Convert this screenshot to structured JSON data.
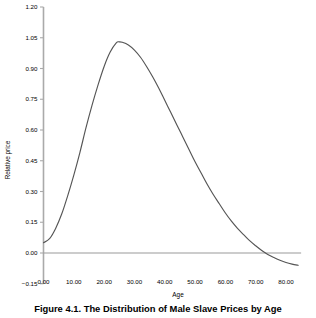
{
  "figure": {
    "caption": "Figure 4.1. The Distribution of Male Slave Prices by Age"
  },
  "chart_data": {
    "type": "line",
    "title": "",
    "subtitle": "",
    "xlabel": "Age",
    "ylabel": "Relative price",
    "xlim": [
      0,
      84
    ],
    "ylim": [
      -0.15,
      1.2
    ],
    "grid": false,
    "legend": null,
    "legend_position": "none",
    "annotations": [],
    "line_color": "#555555",
    "zero_line_color": "#999999",
    "axis_color": "#aaaaaa",
    "background_color": "#ffffff",
    "xticks": [
      "0.00",
      "10.00",
      "20.00",
      "30.00",
      "40.00",
      "50.00",
      "60.00",
      "70.00",
      "80.00"
    ],
    "xtick_values": [
      0,
      10,
      20,
      30,
      40,
      50,
      60,
      70,
      80
    ],
    "yticks": [
      "-0.15",
      "0.00",
      "0.15",
      "0.30",
      "0.45",
      "0.60",
      "0.75",
      "0.90",
      "1.05",
      "1.20"
    ],
    "ytick_values": [
      -0.15,
      0.0,
      0.15,
      0.3,
      0.45,
      0.6,
      0.75,
      0.9,
      1.05,
      1.2
    ],
    "series": [
      {
        "name": "Relative price by age",
        "x": [
          0,
          2,
          4,
          6,
          8,
          10,
          12,
          14,
          16,
          18,
          20,
          22,
          24,
          25,
          26,
          28,
          30,
          32,
          34,
          36,
          38,
          40,
          42,
          44,
          46,
          48,
          50,
          52,
          54,
          56,
          58,
          60,
          62,
          64,
          66,
          68,
          70,
          72,
          74,
          76,
          78,
          80,
          82,
          84
        ],
        "y": [
          0.05,
          0.07,
          0.12,
          0.19,
          0.28,
          0.38,
          0.49,
          0.61,
          0.72,
          0.82,
          0.91,
          0.98,
          1.025,
          1.03,
          1.028,
          1.015,
          0.99,
          0.955,
          0.91,
          0.86,
          0.805,
          0.745,
          0.685,
          0.625,
          0.565,
          0.505,
          0.445,
          0.39,
          0.335,
          0.285,
          0.24,
          0.195,
          0.155,
          0.12,
          0.09,
          0.06,
          0.035,
          0.012,
          -0.007,
          -0.022,
          -0.035,
          -0.046,
          -0.054,
          -0.06
        ]
      }
    ],
    "peak": {
      "x": 25,
      "y": 1.03
    },
    "zero_crossing": {
      "x": 73,
      "y": 0.0
    }
  }
}
